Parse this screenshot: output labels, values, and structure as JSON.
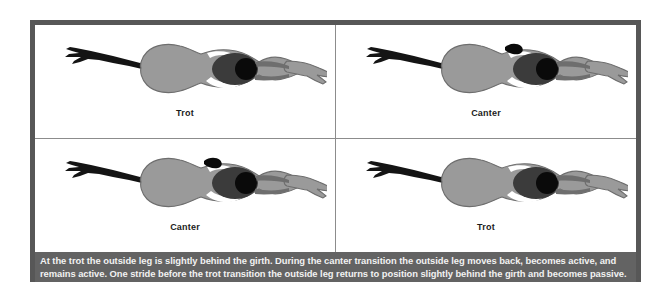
{
  "figure": {
    "frame_color": "#575757",
    "panel_background": "#ffffff",
    "divider_color": "#8c8c8c",
    "caption_band_color": "#636363",
    "caption_text_color": "#f2f2f2",
    "horse_body_color": "#9a9a9a",
    "horse_body_outline": "#6e6e6e",
    "rider_torso_color": "#3b3b3b",
    "rider_head_color": "#0a0a0a",
    "rider_leg_color": "#141414",
    "highlight_color": "#ffffff"
  },
  "panels": [
    {
      "id": "panel-top-left",
      "label": "Trot",
      "position": "top-left",
      "outside_leg_state": "passive",
      "outside_leg_position": "slightly behind the girth",
      "leg_marker_visible": false
    },
    {
      "id": "panel-top-right",
      "label": "Canter",
      "position": "top-right",
      "outside_leg_state": "active",
      "outside_leg_position": "moved back",
      "leg_marker_visible": true
    },
    {
      "id": "panel-bottom-left",
      "label": "Canter",
      "position": "bottom-left",
      "outside_leg_state": "active",
      "outside_leg_position": "moved back",
      "leg_marker_visible": true
    },
    {
      "id": "panel-bottom-right",
      "label": "Trot",
      "position": "bottom-right",
      "outside_leg_state": "passive",
      "outside_leg_position": "slightly behind the girth",
      "leg_marker_visible": false
    }
  ],
  "caption": {
    "text": "At the trot the outside leg is slightly behind the girth. During the canter transition the outside leg moves back, becomes active, and remains active. One stride before the trot transition the outside leg returns to position slightly behind the girth and becomes passive."
  }
}
